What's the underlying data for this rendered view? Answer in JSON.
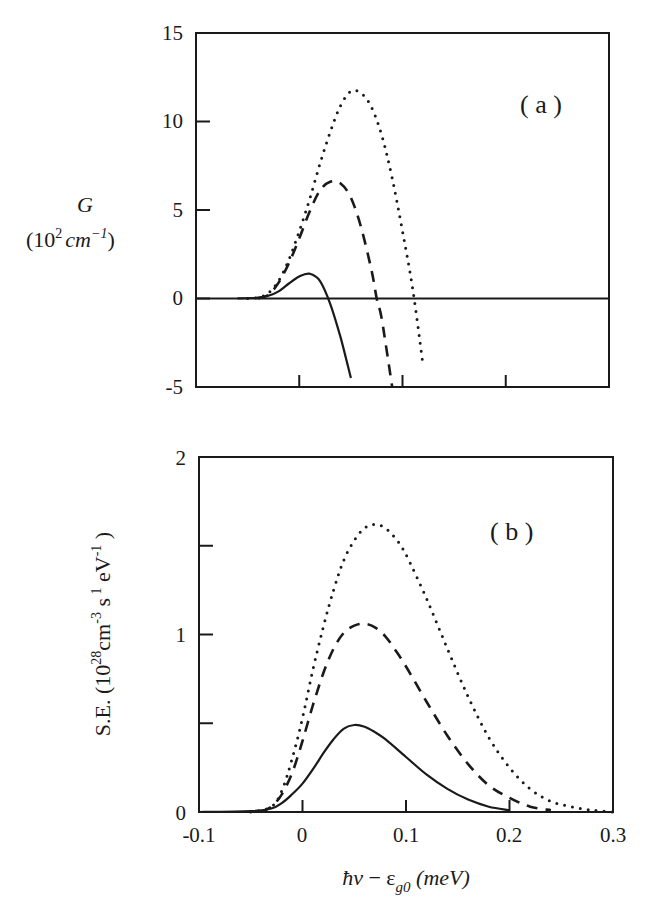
{
  "figure": {
    "panels": [
      {
        "id": "a",
        "label": "( a )"
      },
      {
        "id": "b",
        "label": "( b )"
      }
    ]
  },
  "chart_data": [
    {
      "type": "line",
      "panel": "(a)",
      "title": "",
      "xlabel": "ħν − ε_g0 (meV)",
      "ylabel": "G (10^2 cm^-1)",
      "ylabel_lines": [
        "G",
        "(10² cm⁻¹)"
      ],
      "xlim": [
        -0.1,
        0.3
      ],
      "ylim": [
        -5,
        15
      ],
      "xticks": [
        -0.1,
        0,
        0.1,
        0.2,
        0.3
      ],
      "yticks": [
        -5,
        0,
        5,
        10,
        15
      ],
      "ytick_labels": [
        "-5",
        "0",
        "5",
        "10",
        "15"
      ],
      "grid": false,
      "zero_line": true,
      "legend": null,
      "series": [
        {
          "name": "solid",
          "style": "solid",
          "x": [
            -0.06,
            -0.04,
            -0.03,
            -0.02,
            -0.01,
            0.0,
            0.01,
            0.02,
            0.03,
            0.04,
            0.05
          ],
          "y": [
            0.0,
            0.05,
            0.15,
            0.4,
            0.85,
            1.25,
            1.4,
            1.0,
            -0.3,
            -2.2,
            -4.5
          ]
        },
        {
          "name": "dashed",
          "style": "dashed",
          "x": [
            -0.04,
            -0.03,
            -0.02,
            -0.01,
            0.0,
            0.01,
            0.02,
            0.03,
            0.04,
            0.05,
            0.06,
            0.07,
            0.075,
            0.08,
            0.09
          ],
          "y": [
            0.0,
            0.2,
            0.9,
            2.0,
            3.4,
            4.9,
            6.1,
            6.6,
            6.5,
            5.7,
            4.0,
            1.6,
            0.0,
            -1.2,
            -5.0
          ]
        },
        {
          "name": "dotted",
          "style": "dotted",
          "x": [
            -0.05,
            -0.04,
            -0.03,
            -0.02,
            -0.01,
            0.0,
            0.01,
            0.02,
            0.03,
            0.04,
            0.05,
            0.06,
            0.07,
            0.08,
            0.09,
            0.1,
            0.11,
            0.12
          ],
          "y": [
            0.0,
            0.05,
            0.3,
            1.0,
            2.2,
            3.8,
            5.6,
            7.6,
            9.4,
            10.9,
            11.7,
            11.6,
            10.8,
            9.2,
            6.8,
            3.8,
            0.5,
            -3.8
          ]
        }
      ]
    },
    {
      "type": "line",
      "panel": "(b)",
      "title": "",
      "xlabel": "ħν − ε_g0 (meV)",
      "ylabel": "S.E. (10^28 cm^-3 s^-1 eV^-1)",
      "xlim": [
        -0.1,
        0.3
      ],
      "ylim": [
        0,
        2
      ],
      "xticks": [
        -0.1,
        0,
        0.1,
        0.2,
        0.3
      ],
      "xtick_labels": [
        "-0.1",
        "0",
        "0.1",
        "0.2",
        "0.3"
      ],
      "yticks": [
        0,
        0.5,
        1,
        1.5,
        2
      ],
      "ytick_labels": [
        "0",
        "",
        "1",
        "",
        "2"
      ],
      "grid": false,
      "legend": null,
      "series": [
        {
          "name": "solid",
          "style": "solid",
          "x": [
            -0.1,
            -0.05,
            -0.03,
            -0.02,
            -0.01,
            0.0,
            0.01,
            0.02,
            0.03,
            0.04,
            0.05,
            0.06,
            0.07,
            0.08,
            0.1,
            0.12,
            0.14,
            0.16,
            0.18,
            0.2
          ],
          "y": [
            0.0,
            0.005,
            0.02,
            0.05,
            0.1,
            0.16,
            0.24,
            0.33,
            0.41,
            0.47,
            0.49,
            0.48,
            0.45,
            0.41,
            0.31,
            0.21,
            0.13,
            0.07,
            0.03,
            0.01
          ]
        },
        {
          "name": "dashed",
          "style": "dashed",
          "x": [
            -0.04,
            -0.03,
            -0.02,
            -0.01,
            0.0,
            0.01,
            0.02,
            0.03,
            0.04,
            0.05,
            0.06,
            0.07,
            0.08,
            0.09,
            0.1,
            0.12,
            0.14,
            0.16,
            0.18,
            0.2,
            0.22,
            0.24
          ],
          "y": [
            0.0,
            0.03,
            0.1,
            0.22,
            0.4,
            0.6,
            0.78,
            0.92,
            1.01,
            1.05,
            1.06,
            1.04,
            0.99,
            0.91,
            0.82,
            0.62,
            0.43,
            0.27,
            0.15,
            0.08,
            0.03,
            0.01
          ]
        },
        {
          "name": "dotted",
          "style": "dotted",
          "x": [
            -0.05,
            -0.03,
            -0.02,
            -0.01,
            0.0,
            0.01,
            0.02,
            0.03,
            0.04,
            0.05,
            0.06,
            0.07,
            0.08,
            0.09,
            0.1,
            0.12,
            0.14,
            0.16,
            0.18,
            0.2,
            0.22,
            0.24,
            0.26,
            0.28,
            0.3
          ],
          "y": [
            0.0,
            0.03,
            0.12,
            0.3,
            0.53,
            0.8,
            1.04,
            1.25,
            1.42,
            1.53,
            1.6,
            1.62,
            1.6,
            1.54,
            1.45,
            1.2,
            0.92,
            0.65,
            0.42,
            0.25,
            0.13,
            0.06,
            0.03,
            0.01,
            0.0
          ]
        }
      ]
    }
  ],
  "axes": {
    "a": {
      "ytick_labels": [
        "15",
        "10",
        "5",
        "0",
        "-5"
      ],
      "ylabel_main": "G",
      "ylabel_unit_base": "(10",
      "ylabel_unit_exp": "2",
      "ylabel_unit_cm": "cm",
      "ylabel_unit_cmexp": "−1",
      "ylabel_unit_close": ")"
    },
    "b": {
      "ytick_labels": [
        "2",
        "1",
        "0"
      ],
      "ylabel_text": "S.E.  (10",
      "ylabel_exp1": "28",
      "ylabel_mid1": "cm",
      "ylabel_exp2": "-3",
      "ylabel_mid2": " s",
      "ylabel_exp3": " 1",
      "ylabel_mid3": " eV",
      "ylabel_exp4": "-1",
      "ylabel_close": " )",
      "xtick_labels": [
        "-0.1",
        "0",
        "0.1",
        "0.2",
        "0.3"
      ]
    },
    "xlabel": {
      "hnu": "ħν",
      "minus": " − ε",
      "sub": "g0",
      "unit": " (meV)"
    }
  }
}
